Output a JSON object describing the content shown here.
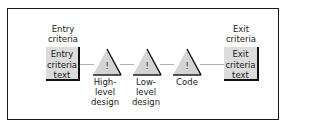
{
  "diagram": {
    "entry": {
      "heading": [
        "Entry",
        "criteria"
      ],
      "box_text": [
        "Entry",
        "criteria",
        "text"
      ]
    },
    "exit": {
      "heading": [
        "Exit",
        "criteria"
      ],
      "box_text": [
        "Exit",
        "criteria",
        "text"
      ]
    },
    "stages": [
      {
        "symbol": "!",
        "label": [
          "High-",
          "level",
          "design"
        ]
      },
      {
        "symbol": "!",
        "label": [
          "Low-",
          "level",
          "design"
        ]
      },
      {
        "symbol": "!",
        "label": [
          "Code"
        ]
      }
    ],
    "colors": {
      "frame": "#1a1a1a",
      "box_fill": "#dcdcdc",
      "triangle_fill": "#d4d4d4",
      "connector": "#b0b0b0"
    }
  }
}
